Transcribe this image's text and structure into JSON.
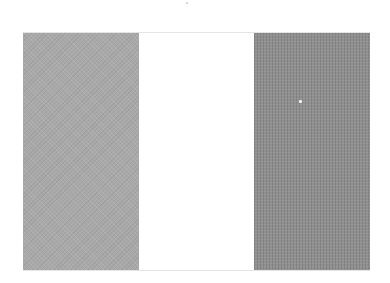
{
  "image": {
    "subject": "tricolor flag with three vertical stripes",
    "stripes": [
      {
        "position": "left",
        "color": "#a9a9a9"
      },
      {
        "position": "middle",
        "color": "#ffffff"
      },
      {
        "position": "right",
        "color": "#8f8f8f"
      }
    ],
    "background": "#ffffff"
  }
}
